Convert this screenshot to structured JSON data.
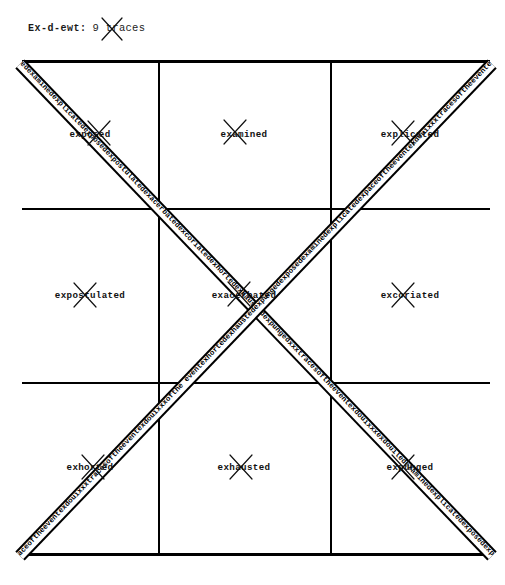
{
  "header": {
    "label": "Ex-d-ewt:",
    "count_text": "9 traces",
    "x_mark": "x-mark-icon"
  },
  "grid": {
    "rows": [
      {
        "cells": [
          {
            "word": "exposed"
          },
          {
            "word": "examined"
          },
          {
            "word": "explicated"
          }
        ]
      },
      {
        "cells": [
          {
            "word": "expostulated"
          },
          {
            "word": "exacerbated"
          },
          {
            "word": "excoriated"
          }
        ]
      },
      {
        "cells": [
          {
            "word": "exhorted"
          },
          {
            "word": "exhausted"
          },
          {
            "word": "expunged"
          }
        ]
      }
    ]
  },
  "diagonals": [
    {
      "id": "diagonal-descending",
      "text": "edexaminedexplicatedexposedexpostulatedexacerbatedexcoriatedexhortedexhaustedexpungedxxxtracesoftheeventexdouixxxexdouil"
    },
    {
      "id": "diagonal-ascending",
      "text": "aceoftheeventexdouixxxtracesoftheeventexdouixxxofthe eventexhortedexhaustedexpungedexposedexaminedexplicatedexp"
    }
  ],
  "colors": {
    "ink": "#000000",
    "paper": "#ffffff"
  }
}
